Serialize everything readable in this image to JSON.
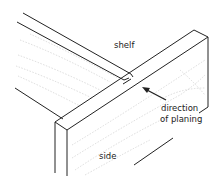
{
  "figure": {
    "labels": {
      "shelf": "shelf",
      "direction_line1": "direction",
      "direction_line2": "of planing",
      "side": "side"
    },
    "parts": [
      "shelf",
      "side"
    ],
    "annotation": {
      "arrow": "direction-arrow",
      "meaning": "direction of planing"
    },
    "colors": {
      "stroke": "#222222",
      "grain": "#bbbbbb",
      "background": "#ffffff"
    }
  }
}
